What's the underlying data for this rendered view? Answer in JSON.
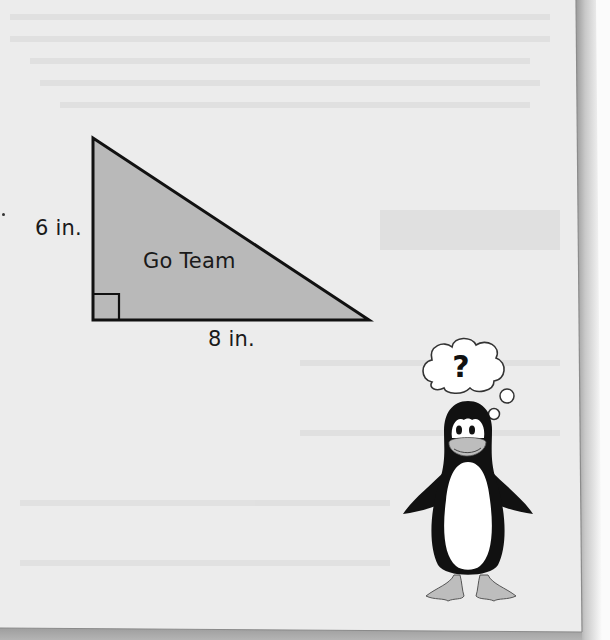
{
  "figure": {
    "shape": "right-triangle",
    "inside_label": "Go Team",
    "height_label": "6 in.",
    "base_label": "8 in.",
    "right_angle_marker": true,
    "colors": {
      "fill": "#b9b9b9",
      "stroke": "#111111",
      "page_background": "#ececec"
    }
  },
  "mascot": {
    "character": "penguin",
    "thought_bubble_symbol": "?",
    "colors": {
      "body": "#111111",
      "belly": "#ffffff",
      "beak_and_feet": "#bdbdbd"
    }
  }
}
